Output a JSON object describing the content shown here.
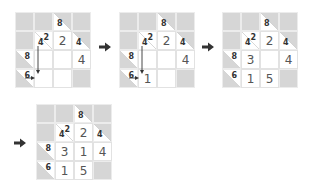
{
  "steps": [
    {
      "id": "step1",
      "cells": [
        [
          {
            "type": "block"
          },
          {
            "type": "block"
          },
          {
            "type": "clue",
            "down": "8",
            "across": ""
          },
          {
            "type": "block"
          }
        ],
        [
          {
            "type": "block"
          },
          {
            "type": "clue",
            "down": "4",
            "across": "2"
          },
          {
            "type": "value",
            "value": "2"
          },
          {
            "type": "clue",
            "down": "4",
            "across": ""
          }
        ],
        [
          {
            "type": "clue",
            "down": "",
            "across": "8"
          },
          {
            "type": "value",
            "value": ""
          },
          {
            "type": "value",
            "value": ""
          },
          {
            "type": "value",
            "value": "4"
          }
        ],
        [
          {
            "type": "clue",
            "down": "",
            "across": "6"
          },
          {
            "type": "value",
            "value": ""
          },
          {
            "type": "value",
            "value": ""
          },
          {
            "type": "block"
          }
        ]
      ],
      "arrows": true
    },
    {
      "id": "step2",
      "cells": [
        [
          {
            "type": "block"
          },
          {
            "type": "block"
          },
          {
            "type": "clue",
            "down": "8",
            "across": ""
          },
          {
            "type": "block"
          }
        ],
        [
          {
            "type": "block"
          },
          {
            "type": "clue",
            "down": "4",
            "across": "2"
          },
          {
            "type": "value",
            "value": "2"
          },
          {
            "type": "clue",
            "down": "4",
            "across": ""
          }
        ],
        [
          {
            "type": "clue",
            "down": "",
            "across": "8"
          },
          {
            "type": "value",
            "value": ""
          },
          {
            "type": "value",
            "value": ""
          },
          {
            "type": "value",
            "value": "4"
          }
        ],
        [
          {
            "type": "clue",
            "down": "",
            "across": "6"
          },
          {
            "type": "value",
            "value": "1"
          },
          {
            "type": "value",
            "value": ""
          },
          {
            "type": "block"
          }
        ]
      ],
      "arrows": true
    },
    {
      "id": "step3",
      "cells": [
        [
          {
            "type": "block"
          },
          {
            "type": "block"
          },
          {
            "type": "clue",
            "down": "8",
            "across": ""
          },
          {
            "type": "block"
          }
        ],
        [
          {
            "type": "block"
          },
          {
            "type": "clue",
            "down": "4",
            "across": "2"
          },
          {
            "type": "value",
            "value": "2"
          },
          {
            "type": "clue",
            "down": "4",
            "across": ""
          }
        ],
        [
          {
            "type": "clue",
            "down": "",
            "across": "8"
          },
          {
            "type": "value",
            "value": "3"
          },
          {
            "type": "value",
            "value": ""
          },
          {
            "type": "value",
            "value": "4"
          }
        ],
        [
          {
            "type": "clue",
            "down": "",
            "across": "6"
          },
          {
            "type": "value",
            "value": "1"
          },
          {
            "type": "value",
            "value": "5"
          },
          {
            "type": "block"
          }
        ]
      ],
      "arrows": false
    },
    {
      "id": "step4",
      "cells": [
        [
          {
            "type": "block"
          },
          {
            "type": "block"
          },
          {
            "type": "clue",
            "down": "8",
            "across": ""
          },
          {
            "type": "block"
          }
        ],
        [
          {
            "type": "block"
          },
          {
            "type": "clue",
            "down": "4",
            "across": "2"
          },
          {
            "type": "value",
            "value": "2"
          },
          {
            "type": "clue",
            "down": "4",
            "across": ""
          }
        ],
        [
          {
            "type": "clue",
            "down": "",
            "across": "8"
          },
          {
            "type": "value",
            "value": "3"
          },
          {
            "type": "value",
            "value": "1"
          },
          {
            "type": "value",
            "value": "4"
          }
        ],
        [
          {
            "type": "clue",
            "down": "",
            "across": "6"
          },
          {
            "type": "value",
            "value": "1"
          },
          {
            "type": "value",
            "value": "5"
          },
          {
            "type": "block"
          }
        ]
      ],
      "arrows": false
    }
  ],
  "transition_icon": "right-arrow-icon",
  "colors": {
    "block": "#d6d6d6",
    "white": "#ffffff",
    "text": "#555555",
    "arrow": "#333333"
  }
}
